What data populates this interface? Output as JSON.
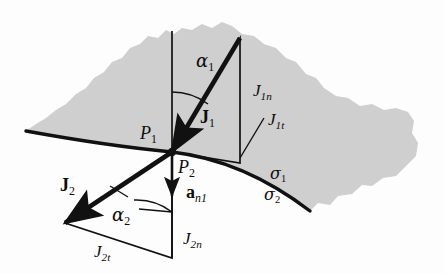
{
  "figure": {
    "domain": "physics-vector-diagram",
    "background_color": "#fdfdfd",
    "region_fill": "#cfcfcf",
    "line_color": "#111111"
  },
  "labels": {
    "alpha1": {
      "base": "α",
      "sub": "1",
      "x": 196,
      "y": 52
    },
    "alpha2": {
      "base": "α",
      "sub": "2",
      "x": 112,
      "y": 206
    },
    "J1_vector": {
      "base": "J",
      "sub": "1",
      "x": 200,
      "y": 108
    },
    "J2_vector": {
      "base": "J",
      "sub": "2",
      "x": 60,
      "y": 176
    },
    "J1n": {
      "base": "J",
      "sub": "1n",
      "x": 253,
      "y": 82
    },
    "J1t": {
      "base": "J",
      "sub": "1t",
      "x": 268,
      "y": 111
    },
    "J2n": {
      "base": "J",
      "sub": "2n",
      "x": 183,
      "y": 230
    },
    "J2t": {
      "base": "J",
      "sub": "2t",
      "x": 94,
      "y": 243
    },
    "P1": {
      "base": "P",
      "sub": "1",
      "x": 140,
      "y": 124
    },
    "P2": {
      "base": "P",
      "sub": "2",
      "x": 178,
      "y": 158
    },
    "an1": {
      "base": "a",
      "sub": "n1",
      "x": 186,
      "y": 183
    },
    "sigma1": {
      "base": "σ",
      "sub": "1",
      "x": 270,
      "y": 166
    },
    "sigma2": {
      "base": "σ",
      "sub": "2",
      "x": 264,
      "y": 187
    }
  },
  "geometry": {
    "origin": {
      "x": 172,
      "y": 152
    },
    "interface_curve": "M26,131 C70,139 120,147 172,152 C224,158 272,182 310,211",
    "region_outline": "M26,131 C70,139 120,147 172,152 C224,158 272,182 310,211 L318,203 L330,205 L338,196 L352,194 L362,185 L372,186 L383,178 L396,176 L406,166 L416,156 L418,143 L412,133 L414,121 L408,112 L396,108 L384,110 L372,104 L360,106 L348,98 L336,96 L324,88 L316,78 L306,74 L296,62 L286,58 L276,48 L264,44 L254,36 L242,34 L232,26 L222,22 L212,28 L202,24 L192,30 L182,28 L174,34 L166,30 L158,38 L148,36 L140,44 L130,48 L122,58 L112,62 L104,72 L94,78 L86,88 L76,94 L66,104 L56,110 L46,118 L36,124 Z",
    "normal_line_top": {
      "x1": 172,
      "y1": 31,
      "x2": 172,
      "y2": 152
    },
    "normal_line_bottom": {
      "x1": 172,
      "y1": 152,
      "x2": 172,
      "y2": 258
    },
    "vector_J1": {
      "x1": 240,
      "y1": 38,
      "x2": 172,
      "y2": 152
    },
    "vector_J2": {
      "x1": 172,
      "y1": 152,
      "x2": 65,
      "y2": 223
    },
    "vector_an1": {
      "x1": 172,
      "y1": 152,
      "x2": 172,
      "y2": 196
    },
    "triangle_upper": "M240,38 L240,163 L172,152 Z",
    "triangle_lower": "M172,152 L65,223 L172,258 Z",
    "arc_alpha1": "M172,92 A60,60 0 0 1 208,104",
    "arc_alpha2": "M134,200 A58,58 0 0 1 172,212",
    "leader_J1t": {
      "x1": 264,
      "y1": 118,
      "x2": 240,
      "y2": 158
    },
    "leader_alpha2_left": {
      "x1": 128,
      "y1": 197,
      "x2": 110,
      "y2": 186
    },
    "leader_alpha2_right": {
      "x1": 139,
      "y1": 209,
      "x2": 172,
      "y2": 212
    }
  }
}
